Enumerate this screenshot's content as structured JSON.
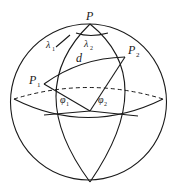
{
  "diagram": {
    "type": "spherical-geometry",
    "labels": {
      "pole": "P",
      "point1": "P",
      "point1_sub": "1",
      "point2": "P",
      "point2_sub": "2",
      "distance": "d",
      "lambda1": "λ",
      "lambda1_sub": "1",
      "lambda2": "λ",
      "lambda2_sub": "2",
      "phi1": "φ",
      "phi1_sub": "1",
      "phi2": "φ",
      "phi2_sub": "2"
    },
    "colors": {
      "stroke": "#1a1a1a",
      "background": "#ffffff"
    }
  }
}
